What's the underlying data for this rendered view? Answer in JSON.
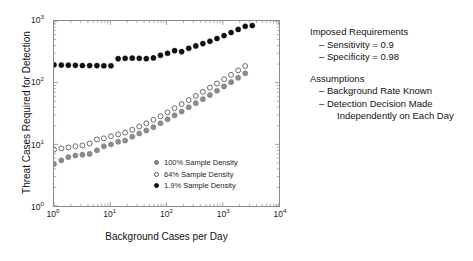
{
  "chart_data": {
    "type": "scatter",
    "title": "",
    "xlabel": "Background Cases per Day",
    "ylabel": "Threat Cases Required for Detection",
    "xscale": "log",
    "yscale": "log",
    "xlim": [
      1,
      10000
    ],
    "ylim": [
      1,
      1000
    ],
    "grid": false,
    "legend_position": "inside-lower-right",
    "xticks": [
      "10^0",
      "10^1",
      "10^2",
      "10^3",
      "10^4"
    ],
    "xtick_labels": [
      "10",
      "10",
      "10",
      "10",
      "10"
    ],
    "xtick_exponents": [
      "0",
      "1",
      "2",
      "3",
      "4"
    ],
    "yticks": [
      "10^0",
      "10^1",
      "10^2",
      "10^3"
    ],
    "ytick_labels": [
      "10",
      "10",
      "10",
      "10"
    ],
    "ytick_exponents": [
      "0",
      "1",
      "2",
      "3"
    ],
    "series": [
      {
        "name": "100% Sample Density",
        "marker": "filled-circle",
        "color": "#8c8c8c",
        "points": [
          [
            1.0,
            4.8
          ],
          [
            1.35,
            5.5
          ],
          [
            1.8,
            6.2
          ],
          [
            2.4,
            6.6
          ],
          [
            3.2,
            6.8
          ],
          [
            4.3,
            7.0
          ],
          [
            5.8,
            8.0
          ],
          [
            7.7,
            9.3
          ],
          [
            10.3,
            10.0
          ],
          [
            13.8,
            11.0
          ],
          [
            18.4,
            11.5
          ],
          [
            24.6,
            13.3
          ],
          [
            32.8,
            15.0
          ],
          [
            43.8,
            16.8
          ],
          [
            58.5,
            19.0
          ],
          [
            78.1,
            22.0
          ],
          [
            104.3,
            25.5
          ],
          [
            139.3,
            29.5
          ],
          [
            186.0,
            34.0
          ],
          [
            248.4,
            40.0
          ],
          [
            331.7,
            46.5
          ],
          [
            442.9,
            54.0
          ],
          [
            591.4,
            63.0
          ],
          [
            789.7,
            74.0
          ],
          [
            1054.5,
            87.0
          ],
          [
            1408.0,
            102.0
          ],
          [
            1880.0,
            120.0
          ],
          [
            2510.0,
            142.0
          ]
        ]
      },
      {
        "name": "64% Sample Density",
        "marker": "open-circle",
        "color": "#ffffff",
        "points": [
          [
            1.0,
            8.2
          ],
          [
            1.35,
            8.6
          ],
          [
            1.8,
            8.9
          ],
          [
            2.4,
            9.3
          ],
          [
            3.2,
            9.6
          ],
          [
            4.3,
            10.3
          ],
          [
            5.8,
            12.0
          ],
          [
            7.7,
            12.5
          ],
          [
            10.3,
            13.5
          ],
          [
            13.8,
            14.5
          ],
          [
            18.4,
            15.5
          ],
          [
            24.6,
            17.2
          ],
          [
            32.8,
            19.5
          ],
          [
            43.8,
            22.0
          ],
          [
            58.5,
            25.0
          ],
          [
            78.1,
            28.5
          ],
          [
            104.3,
            33.0
          ],
          [
            139.3,
            38.5
          ],
          [
            186.0,
            45.0
          ],
          [
            248.4,
            52.0
          ],
          [
            331.7,
            61.0
          ],
          [
            442.9,
            71.0
          ],
          [
            591.4,
            83.0
          ],
          [
            789.7,
            97.0
          ],
          [
            1054.5,
            114.0
          ],
          [
            1408.0,
            134.0
          ],
          [
            1880.0,
            158.0
          ],
          [
            2510.0,
            186.0
          ]
        ]
      },
      {
        "name": "1.9% Sample Density",
        "marker": "filled-circle",
        "color": "#111111",
        "points": [
          [
            1.0,
            195.0
          ],
          [
            1.35,
            193.0
          ],
          [
            1.8,
            192.0
          ],
          [
            2.4,
            191.0
          ],
          [
            3.2,
            190.0
          ],
          [
            4.3,
            189.0
          ],
          [
            5.8,
            189.0
          ],
          [
            7.7,
            188.0
          ],
          [
            10.3,
            188.0
          ],
          [
            13.8,
            245.0
          ],
          [
            18.4,
            248.0
          ],
          [
            24.6,
            250.0
          ],
          [
            32.8,
            248.0
          ],
          [
            43.8,
            245.0
          ],
          [
            58.5,
            252.0
          ],
          [
            78.1,
            278.0
          ],
          [
            104.3,
            300.0
          ],
          [
            139.3,
            330.0
          ],
          [
            186.0,
            318.0
          ],
          [
            248.4,
            360.0
          ],
          [
            331.7,
            395.0
          ],
          [
            442.9,
            430.0
          ],
          [
            591.4,
            470.0
          ],
          [
            789.7,
            520.0
          ],
          [
            1054.5,
            580.0
          ],
          [
            1408.0,
            650.0
          ],
          [
            1880.0,
            730.0
          ],
          [
            2510.0,
            820.0
          ],
          [
            3350.0,
            845.0
          ]
        ]
      }
    ]
  },
  "legend": {
    "items": [
      {
        "label": "100% Sample Density",
        "style": "dot-gray"
      },
      {
        "label": "64% Sample Density",
        "style": "dot-open"
      },
      {
        "label": "1.9% Sample Density",
        "style": "dot-black"
      }
    ]
  },
  "annotations": {
    "requirements": {
      "title": "Imposed Requirements",
      "items": [
        "– Sensitivity = 0.9",
        "– Specificity = 0.98"
      ]
    },
    "assumptions": {
      "title": "Assumptions",
      "items": [
        "– Background Rate Known"
      ],
      "wrapped_item": {
        "line1": "– Detection Decision Made",
        "line2": "Independently on Each Day"
      }
    }
  }
}
